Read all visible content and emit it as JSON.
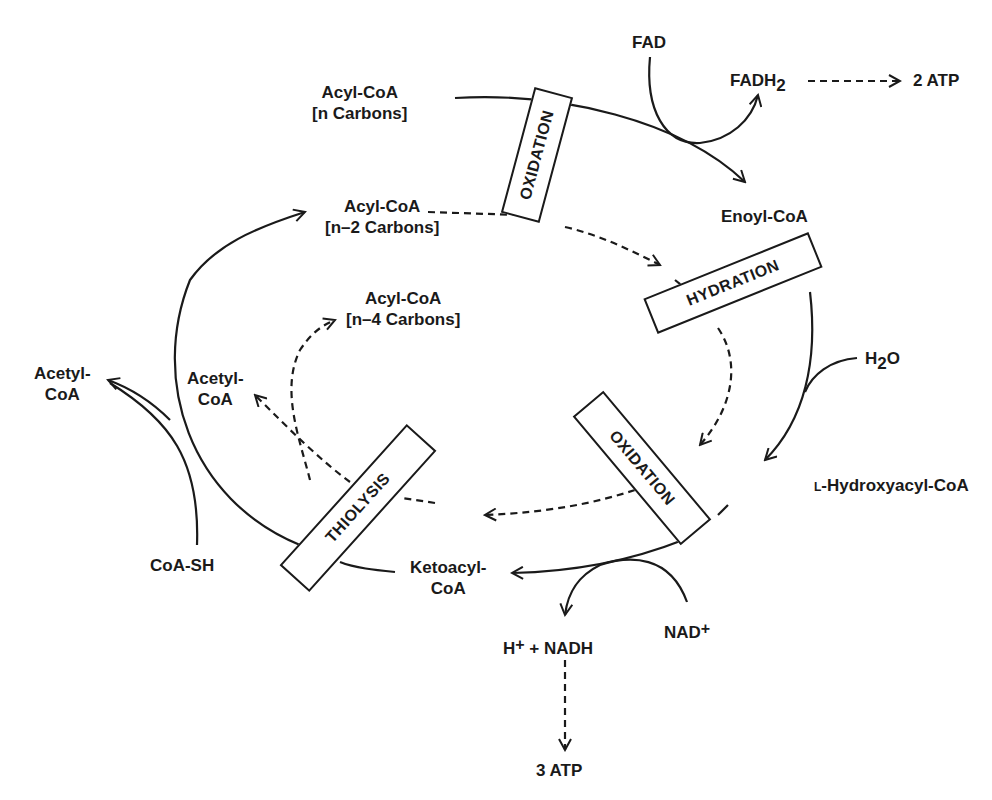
{
  "diagram": {
    "stroke_color": "#1a1a1a",
    "background": "#ffffff",
    "steps": [
      {
        "id": "oxidation-1",
        "label": "OXIDATION"
      },
      {
        "id": "hydration",
        "label": "HYDRATION"
      },
      {
        "id": "oxidation-2",
        "label": "OXIDATION"
      },
      {
        "id": "thiolysis",
        "label": "THIOLYSIS"
      }
    ],
    "intermediates": {
      "acyl_coa_n": {
        "line1": "Acyl-CoA",
        "line2": "[n Carbons]"
      },
      "acyl_coa_n2": {
        "line1": "Acyl-CoA",
        "line2": "[n–2 Carbons]"
      },
      "acyl_coa_n4": {
        "line1": "Acyl-CoA",
        "line2": "[n–4 Carbons]"
      },
      "enoyl_coa": "Enoyl-CoA",
      "hydroxyacyl_coa": {
        "prefix": "L",
        "name": "-Hydroxyacyl-CoA"
      },
      "ketoacyl_coa": {
        "line1": "Ketoacyl-",
        "line2": "CoA"
      },
      "acetyl_coa_outer": {
        "line1": "Acetyl-",
        "line2": "CoA"
      },
      "acetyl_coa_inner": {
        "line1": "Acetyl-",
        "line2": "CoA"
      }
    },
    "cofactors": {
      "fad": "FAD",
      "fadh2": {
        "base": "FADH",
        "sub": "2"
      },
      "atp_2": "2 ATP",
      "h2o": {
        "h": "H",
        "sub": "2",
        "o": "O"
      },
      "nad": {
        "base": "NAD",
        "sup": "+"
      },
      "nadh": {
        "h": "H",
        "sup": "+",
        "rest": " + NADH"
      },
      "atp_3": "3 ATP",
      "coa_sh": "CoA-SH"
    }
  }
}
